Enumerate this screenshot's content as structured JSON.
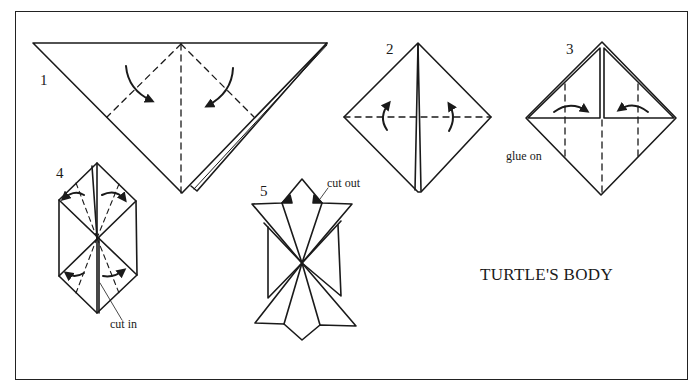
{
  "diagram": {
    "title": "TURTLE'S BODY",
    "steps": [
      {
        "number": "1"
      },
      {
        "number": "2"
      },
      {
        "number": "3",
        "annotation": "glue on"
      },
      {
        "number": "4",
        "annotation": "cut in"
      },
      {
        "number": "5",
        "annotation": "cut out"
      }
    ],
    "colors": {
      "line": "#1a1a1a",
      "background": "#ffffff"
    }
  }
}
